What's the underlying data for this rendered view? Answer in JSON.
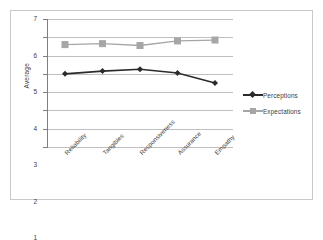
{
  "chart_data": {
    "type": "line",
    "title": "",
    "xlabel": "",
    "ylabel": "Average",
    "categories": [
      "Reliability",
      "Tangibles",
      "Responsiveness",
      "Assurance",
      "Empathy"
    ],
    "yticks": [
      0,
      1,
      2,
      3,
      4,
      5,
      6,
      7
    ],
    "ylim": [
      0,
      7
    ],
    "grid": true,
    "legend_position": "right",
    "series": [
      {
        "name": "Perceptions",
        "color": "#2b2b2b",
        "marker": "diamond",
        "values": [
          4.0,
          4.15,
          4.25,
          4.05,
          3.5
        ]
      },
      {
        "name": "Expectations",
        "color": "#a6a6a6",
        "marker": "square",
        "values": [
          5.6,
          5.65,
          5.55,
          5.8,
          5.85
        ]
      }
    ]
  },
  "colors": {
    "perceptions": "#2b2b2b",
    "expectations": "#a6a6a6",
    "gridline": "#bfbfbf",
    "axis": "#7f7f7f",
    "border": "#c9c9c9",
    "text": "#3d3d3d"
  }
}
